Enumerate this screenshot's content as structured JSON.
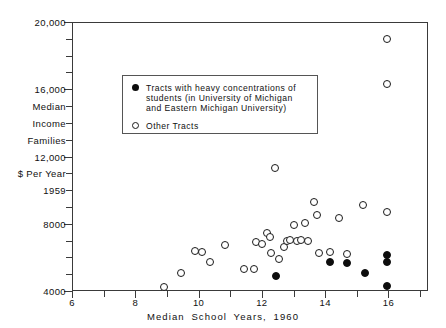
{
  "chart_data": {
    "type": "scatter",
    "title": "",
    "xlabel": "Median  School   Years,  1960",
    "ylabel_lines": [
      "Median",
      "Income",
      "Families",
      "$ Per Year",
      "1959"
    ],
    "xlim": [
      6,
      17.25
    ],
    "ylim": [
      4000,
      20000
    ],
    "grid": false,
    "xticks_major": [
      6,
      8,
      10,
      12,
      14,
      16
    ],
    "xticks_major_labels": [
      "6",
      "8",
      "10",
      "12",
      "14",
      "16"
    ],
    "xticks_minor": [
      7,
      9,
      11,
      13,
      15,
      17
    ],
    "yticks_major": [
      4000,
      8000,
      12000,
      16000,
      20000
    ],
    "yticks_major_labels": [
      "4000",
      "8000",
      "12,000",
      "16,000",
      "20,000"
    ],
    "yticks_minor": [
      5000,
      6000,
      7000,
      9000,
      10000,
      11000,
      13000,
      14000,
      15000,
      17000,
      18000,
      19000
    ],
    "y_axis_annotations": [
      {
        "value": 15000,
        "text": "Median"
      },
      {
        "value": 14000,
        "text": "Income"
      },
      {
        "value": 13000,
        "text": "Families"
      },
      {
        "value": 11000,
        "text": "$ Per Year"
      },
      {
        "value": 10000,
        "text": "1959"
      }
    ],
    "legend_position": "upper-left-inside",
    "series": [
      {
        "name": "Tracts with heavy concentrations of students (in University of Michigan and Eastern Michigan University)",
        "marker": "filled-circle",
        "color": "#0d0d0d",
        "points": [
          [
            12.45,
            4900
          ],
          [
            14.15,
            5700
          ],
          [
            14.7,
            5650
          ],
          [
            15.25,
            5100
          ],
          [
            15.95,
            6150
          ],
          [
            15.95,
            5700
          ],
          [
            15.95,
            4300
          ]
        ]
      },
      {
        "name": "Other Tracts",
        "marker": "open-circle",
        "color": "#1a1a1a",
        "points": [
          [
            8.9,
            4250
          ],
          [
            9.45,
            5100
          ],
          [
            9.9,
            6350
          ],
          [
            10.1,
            6300
          ],
          [
            10.35,
            5700
          ],
          [
            10.85,
            6750
          ],
          [
            11.45,
            5300
          ],
          [
            11.75,
            5300
          ],
          [
            11.8,
            6900
          ],
          [
            12.0,
            6800
          ],
          [
            12.15,
            7450
          ],
          [
            12.25,
            7200
          ],
          [
            12.3,
            6250
          ],
          [
            12.4,
            11300
          ],
          [
            12.55,
            5900
          ],
          [
            12.7,
            6600
          ],
          [
            12.8,
            7000
          ],
          [
            12.9,
            7050
          ],
          [
            13.0,
            7900
          ],
          [
            13.1,
            6950
          ],
          [
            13.25,
            7050
          ],
          [
            13.35,
            8050
          ],
          [
            13.45,
            6950
          ],
          [
            13.65,
            9300
          ],
          [
            13.75,
            8550
          ],
          [
            13.8,
            6250
          ],
          [
            14.15,
            6300
          ],
          [
            14.45,
            8350
          ],
          [
            14.7,
            6200
          ],
          [
            15.2,
            9100
          ],
          [
            15.95,
            8700
          ],
          [
            15.95,
            19000
          ],
          [
            15.95,
            16300
          ]
        ]
      }
    ]
  },
  "legend": {
    "entries": [
      {
        "marker": "filled-circle",
        "lines": [
          "Tracts  with  heavy  concentrations  of",
          "students (in University of Michigan",
          "and Eastern Michigan University)"
        ]
      },
      {
        "marker": "open-circle",
        "lines": [
          "Other Tracts"
        ]
      }
    ]
  }
}
